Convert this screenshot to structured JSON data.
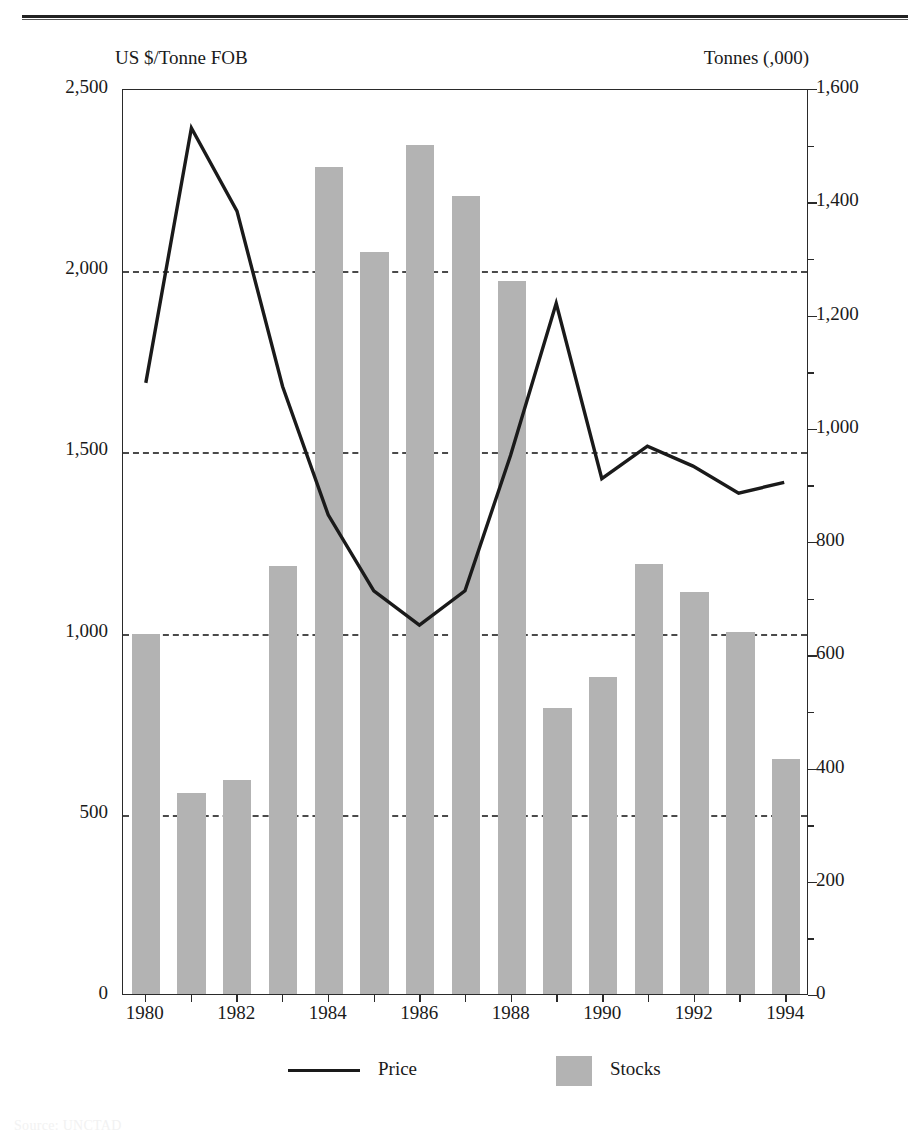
{
  "figure": {
    "left_axis_title": "US $/Tonne FOB",
    "right_axis_title": "Tonnes (,000)"
  },
  "legend": {
    "price_label": "Price",
    "stocks_label": "Stocks"
  },
  "source_note": "Source: UNCTAD",
  "colors": {
    "bar_fill": "#b3b3b3",
    "line": "#1a1a1a",
    "gridline": "#4a4a4a",
    "frame": "#2a2a2a"
  },
  "chart_data": {
    "type": "bar",
    "title": "",
    "subtitle": "",
    "xlabel": "",
    "ylabel": "US $/Tonne FOB",
    "y2label": "Tonnes (,000)",
    "grid": true,
    "legend_position": "bottom",
    "x": [
      1980,
      1981,
      1982,
      1983,
      1984,
      1985,
      1986,
      1987,
      1988,
      1989,
      1990,
      1991,
      1992,
      1993,
      1994
    ],
    "categories": [
      "1980",
      "1981",
      "1982",
      "1983",
      "1984",
      "1985",
      "1986",
      "1987",
      "1988",
      "1989",
      "1990",
      "1991",
      "1992",
      "1993",
      "1994"
    ],
    "x_tick_labels": [
      "1980",
      "1982",
      "1984",
      "1986",
      "1988",
      "1990",
      "1992",
      "1994"
    ],
    "x_tick_values": [
      1980,
      1982,
      1984,
      1986,
      1988,
      1990,
      1992,
      1994
    ],
    "ylim": [
      0,
      2500
    ],
    "y_tick_labels": [
      "0",
      "500",
      "1,000",
      "1,500",
      "2,000",
      "2,500"
    ],
    "y_tick_values": [
      0,
      500,
      1000,
      1500,
      2000,
      2500
    ],
    "y2lim": [
      0,
      1600
    ],
    "y2_tick_labels": [
      "0",
      "200",
      "400",
      "600",
      "800",
      "1,000",
      "1,200",
      "1,400",
      "1,600"
    ],
    "y2_tick_values": [
      0,
      200,
      400,
      600,
      800,
      1000,
      1200,
      1400,
      1600
    ],
    "gridline_values": [
      500,
      1000,
      1500,
      2000
    ],
    "series": [
      {
        "name": "Stocks",
        "type": "bar",
        "axis": "right",
        "units": "Tonnes (,000)",
        "color": "#b3b3b3",
        "values": [
          635,
          355,
          378,
          755,
          1460,
          1310,
          1500,
          1410,
          1260,
          505,
          560,
          760,
          710,
          640,
          415
        ]
      },
      {
        "name": "Price",
        "type": "line",
        "axis": "left",
        "units": "US $/Tonne FOB",
        "color": "#1a1a1a",
        "values": [
          1690,
          2395,
          2165,
          1680,
          1325,
          1115,
          1020,
          1115,
          1490,
          1910,
          1425,
          1515,
          1460,
          1385,
          1415
        ]
      }
    ]
  }
}
